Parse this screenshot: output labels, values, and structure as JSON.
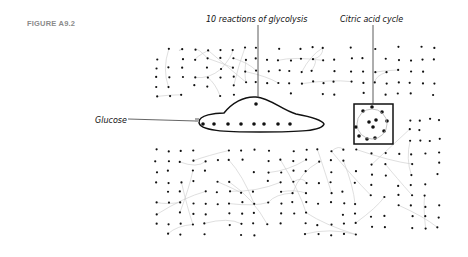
{
  "figure": {
    "label": "FIGURE A9.2",
    "annotations": {
      "glycolysis": "10 reactions of glycolysis",
      "citric_acid_cycle": "Citric acid cycle",
      "glucose": "Glucose"
    }
  },
  "colors": {
    "node": "#111111",
    "edge": "#c9c9c9",
    "highlight": "#111111",
    "label_gray": "#8a8a8a"
  },
  "network": {
    "bounds": {
      "x": 145,
      "y": 40,
      "w": 300,
      "h": 205
    },
    "regions": [
      {
        "name": "upper-left",
        "x": 150,
        "y": 45,
        "w": 90,
        "h": 55,
        "rows": 6,
        "cols": 7
      },
      {
        "name": "upper-mid",
        "x": 240,
        "y": 42,
        "w": 100,
        "h": 58,
        "rows": 5,
        "cols": 9
      },
      {
        "name": "upper-right",
        "x": 345,
        "y": 42,
        "w": 95,
        "h": 58,
        "rows": 5,
        "cols": 8
      },
      {
        "name": "lower-left",
        "x": 150,
        "y": 145,
        "w": 110,
        "h": 95,
        "rows": 9,
        "cols": 9
      },
      {
        "name": "lower-mid",
        "x": 262,
        "y": 145,
        "w": 100,
        "h": 95,
        "rows": 9,
        "cols": 8
      },
      {
        "name": "lower-right",
        "x": 365,
        "y": 148,
        "w": 80,
        "h": 85,
        "rows": 8,
        "cols": 6
      },
      {
        "name": "right-side",
        "x": 405,
        "y": 115,
        "w": 40,
        "h": 30,
        "rows": 3,
        "cols": 4
      }
    ],
    "glycolysis_nodes": [
      [
        203,
        124
      ],
      [
        214,
        124
      ],
      [
        228,
        124
      ],
      [
        241,
        124
      ],
      [
        254,
        124
      ],
      [
        264,
        124
      ],
      [
        278,
        124
      ],
      [
        290,
        124
      ],
      [
        256,
        104
      ]
    ],
    "tca_nodes": [
      [
        363,
        111
      ],
      [
        372,
        107
      ],
      [
        382,
        112
      ],
      [
        387,
        121
      ],
      [
        384,
        131
      ],
      [
        375,
        138
      ],
      [
        367,
        139
      ],
      [
        359,
        136
      ],
      [
        356,
        127
      ],
      [
        369,
        122
      ],
      [
        376,
        120
      ],
      [
        373,
        127
      ]
    ]
  }
}
